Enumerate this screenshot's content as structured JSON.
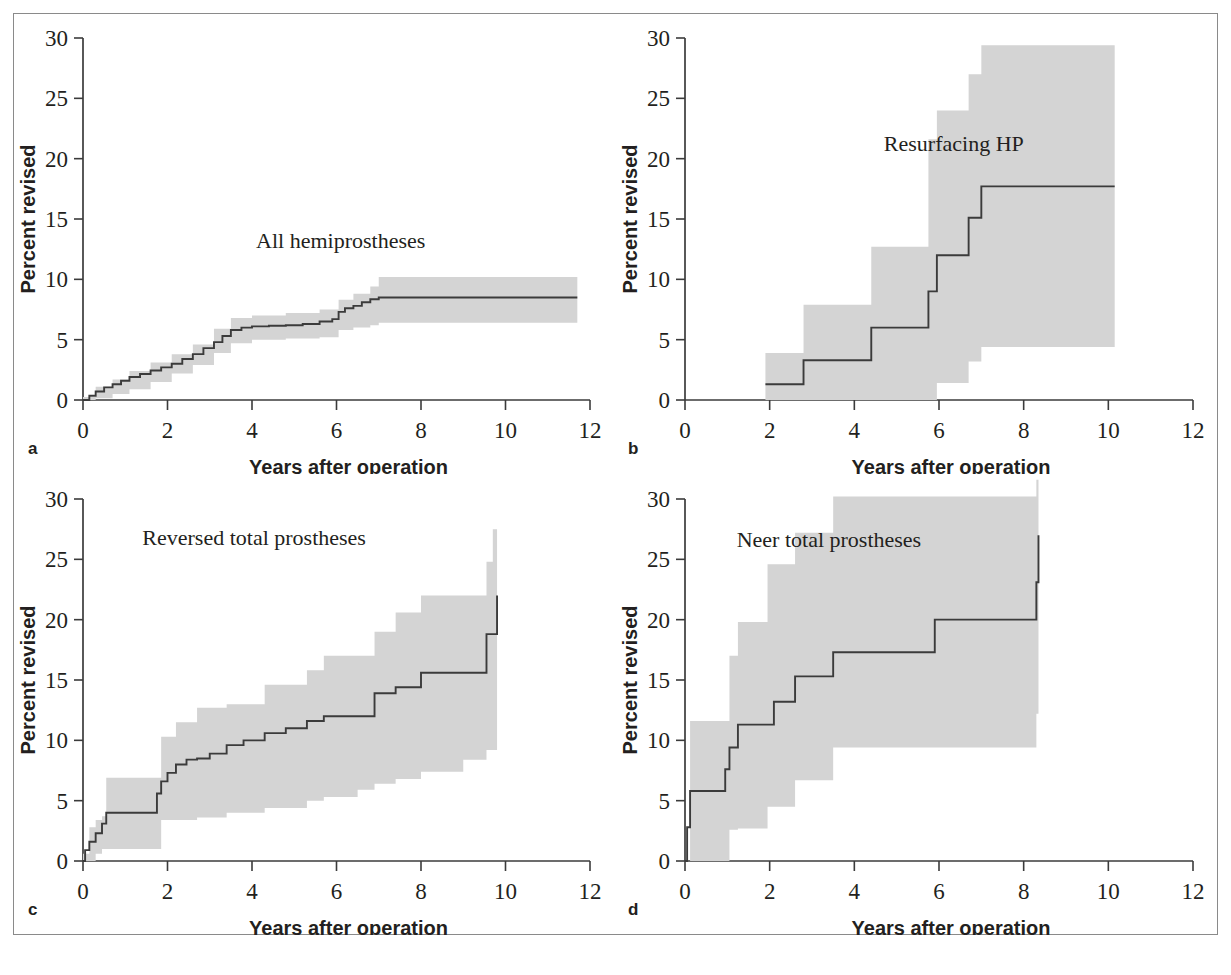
{
  "figure": {
    "kind": "kaplan-meier-revision-panels",
    "panel_count": 4,
    "band_color": "#d4d4d4",
    "line_color": "#3b3b3b"
  },
  "panels": [
    {
      "letter": "a",
      "curve_label": "All hemiprostheses",
      "xlabel": "Years after operation",
      "ylabel": "Percent revised",
      "xticks": [
        "0",
        "2",
        "4",
        "6",
        "8",
        "10",
        "12"
      ],
      "yticks": [
        "0",
        "5",
        "10",
        "15",
        "20",
        "25",
        "30"
      ]
    },
    {
      "letter": "b",
      "curve_label": "Resurfacing HP",
      "xlabel": "Years after operation",
      "ylabel": "Percent revised",
      "xticks": [
        "0",
        "2",
        "4",
        "6",
        "8",
        "10",
        "12"
      ],
      "yticks": [
        "0",
        "5",
        "10",
        "15",
        "20",
        "25",
        "30"
      ]
    },
    {
      "letter": "c",
      "curve_label": "Reversed total prostheses",
      "xlabel": "Years after operation",
      "ylabel": "Percent revised",
      "xticks": [
        "0",
        "2",
        "4",
        "6",
        "8",
        "10",
        "12"
      ],
      "yticks": [
        "0",
        "5",
        "10",
        "15",
        "20",
        "25",
        "30"
      ]
    },
    {
      "letter": "d",
      "curve_label": "Neer total prostheses",
      "xlabel": "Years after operation",
      "ylabel": "Percent revised",
      "xticks": [
        "0",
        "2",
        "4",
        "6",
        "8",
        "10",
        "12"
      ],
      "yticks": [
        "0",
        "5",
        "10",
        "15",
        "20",
        "25",
        "30"
      ]
    }
  ],
  "chart_data": [
    {
      "type": "line",
      "panel": "a",
      "title": "All hemiprostheses",
      "xlabel": "Years after operation",
      "ylabel": "Percent revised",
      "xlim": [
        0,
        12
      ],
      "ylim": [
        0,
        30
      ],
      "xticks": [
        0,
        2,
        4,
        6,
        8,
        10,
        12
      ],
      "yticks": [
        0,
        5,
        10,
        15,
        20,
        25,
        30
      ],
      "grid": false,
      "legend": "none",
      "annotation": "All hemiprostheses",
      "series": [
        {
          "name": "Cumulative percent revised",
          "style": "step",
          "x": [
            0,
            0.15,
            0.3,
            0.5,
            0.7,
            0.9,
            1.1,
            1.35,
            1.6,
            1.85,
            2.1,
            2.35,
            2.6,
            2.85,
            3.1,
            3.3,
            3.5,
            3.75,
            4.0,
            4.4,
            4.8,
            5.2,
            5.6,
            5.9,
            6.05,
            6.2,
            6.4,
            6.6,
            6.8,
            7.0,
            8.0,
            9.0,
            10.0,
            11.0,
            11.7
          ],
          "y": [
            0.0,
            0.35,
            0.7,
            1.05,
            1.3,
            1.6,
            1.9,
            2.15,
            2.45,
            2.7,
            3.0,
            3.4,
            3.8,
            4.3,
            4.8,
            5.3,
            5.8,
            6.0,
            6.1,
            6.15,
            6.2,
            6.3,
            6.5,
            6.7,
            7.3,
            7.6,
            7.8,
            8.1,
            8.35,
            8.5,
            8.5,
            8.5,
            8.5,
            8.5,
            8.5
          ]
        },
        {
          "name": "95% CI upper",
          "style": "step",
          "x": [
            0,
            0.3,
            0.7,
            1.1,
            1.6,
            2.1,
            2.6,
            3.1,
            3.5,
            4.0,
            4.8,
            5.6,
            6.05,
            6.4,
            6.8,
            7.0,
            8.0,
            10.0,
            11.7
          ],
          "y": [
            0.25,
            1.1,
            1.7,
            2.4,
            3.1,
            3.8,
            4.6,
            5.9,
            6.8,
            7.0,
            7.2,
            7.5,
            8.3,
            8.8,
            9.4,
            10.2,
            10.2,
            10.2,
            10.2
          ]
        },
        {
          "name": "95% CI lower",
          "style": "step",
          "x": [
            0,
            0.3,
            0.7,
            1.1,
            1.6,
            2.1,
            2.6,
            3.1,
            3.5,
            4.0,
            4.8,
            5.6,
            6.05,
            6.4,
            6.8,
            7.0,
            8.0,
            10.0,
            11.7
          ],
          "y": [
            0.0,
            0.15,
            0.5,
            0.9,
            1.5,
            2.2,
            2.9,
            3.9,
            4.7,
            5.0,
            5.1,
            5.2,
            5.8,
            6.0,
            6.2,
            6.4,
            6.4,
            6.4,
            6.4
          ]
        }
      ]
    },
    {
      "type": "line",
      "panel": "b",
      "title": "Resurfacing HP",
      "xlabel": "Years after operation",
      "ylabel": "Percent revised",
      "xlim": [
        0,
        12
      ],
      "ylim": [
        0,
        30
      ],
      "xticks": [
        0,
        2,
        4,
        6,
        8,
        10,
        12
      ],
      "yticks": [
        0,
        5,
        10,
        15,
        20,
        25,
        30
      ],
      "grid": false,
      "legend": "none",
      "annotation": "Resurfacing HP",
      "series": [
        {
          "name": "Cumulative percent revised",
          "style": "step",
          "x": [
            1.9,
            2.8,
            4.4,
            5.75,
            5.95,
            6.7,
            7.0,
            10.15
          ],
          "y": [
            1.3,
            3.3,
            6.0,
            9.0,
            12.0,
            15.1,
            17.7,
            17.7
          ]
        },
        {
          "name": "95% CI upper",
          "style": "step",
          "x": [
            1.9,
            2.8,
            4.4,
            5.75,
            5.95,
            6.7,
            7.0,
            10.15
          ],
          "y": [
            3.9,
            7.9,
            12.7,
            21.6,
            24.0,
            27.0,
            29.4,
            29.4
          ]
        },
        {
          "name": "95% CI lower",
          "style": "step",
          "x": [
            1.9,
            2.8,
            4.4,
            5.75,
            5.95,
            6.7,
            7.0,
            10.15
          ],
          "y": [
            0.0,
            0.0,
            0.0,
            0.0,
            1.4,
            3.2,
            4.4,
            4.4
          ]
        }
      ]
    },
    {
      "type": "line",
      "panel": "c",
      "title": "Reversed total prostheses",
      "xlabel": "Years after operation",
      "ylabel": "Percent revised",
      "xlim": [
        0,
        12
      ],
      "ylim": [
        0,
        30
      ],
      "xticks": [
        0,
        2,
        4,
        6,
        8,
        10,
        12
      ],
      "yticks": [
        0,
        5,
        10,
        15,
        20,
        25,
        30
      ],
      "grid": false,
      "legend": "none",
      "annotation": "Reversed total prostheses",
      "series": [
        {
          "name": "Cumulative percent revised",
          "style": "step",
          "x": [
            0,
            0.05,
            0.15,
            0.3,
            0.45,
            0.55,
            1.6,
            1.75,
            1.85,
            2.0,
            2.2,
            2.45,
            2.7,
            3.0,
            3.4,
            3.8,
            4.3,
            4.8,
            5.3,
            5.7,
            6.5,
            6.9,
            7.4,
            8.0,
            9.0,
            9.55,
            9.8
          ],
          "y": [
            0.0,
            0.9,
            1.6,
            2.3,
            3.1,
            4.0,
            4.0,
            5.6,
            6.6,
            7.3,
            8.0,
            8.4,
            8.5,
            8.9,
            9.6,
            10.0,
            10.6,
            11.0,
            11.6,
            12.0,
            12.0,
            13.9,
            14.4,
            15.6,
            15.6,
            18.8,
            22.0
          ]
        },
        {
          "name": "95% CI upper",
          "style": "step",
          "x": [
            0,
            0.15,
            0.3,
            0.45,
            0.55,
            1.6,
            1.85,
            2.2,
            2.7,
            3.4,
            4.3,
            5.3,
            5.7,
            6.5,
            6.9,
            7.4,
            8.0,
            9.0,
            9.55,
            9.7,
            9.8
          ],
          "y": [
            0.6,
            2.8,
            3.4,
            3.7,
            6.9,
            6.9,
            10.3,
            11.5,
            12.7,
            13.0,
            14.6,
            15.8,
            17.0,
            17.0,
            19.0,
            20.6,
            22.0,
            22.0,
            24.8,
            27.5,
            31.5
          ]
        },
        {
          "name": "95% CI lower",
          "style": "step",
          "x": [
            0,
            0.15,
            0.3,
            0.45,
            0.55,
            1.6,
            1.85,
            2.2,
            2.7,
            3.4,
            4.3,
            5.3,
            5.7,
            6.5,
            6.9,
            7.4,
            8.0,
            9.0,
            9.55,
            9.8
          ],
          "y": [
            0.0,
            0.0,
            0.6,
            1.0,
            1.0,
            1.0,
            3.4,
            3.4,
            3.6,
            4.0,
            4.4,
            5.0,
            5.3,
            5.9,
            6.4,
            6.8,
            7.4,
            8.4,
            9.2,
            10.2
          ]
        }
      ]
    },
    {
      "type": "line",
      "panel": "d",
      "title": "Neer total prostheses",
      "xlabel": "Years after operation",
      "ylabel": "Percent revised",
      "xlim": [
        0,
        12
      ],
      "ylim": [
        0,
        30
      ],
      "xticks": [
        0,
        2,
        4,
        6,
        8,
        10,
        12
      ],
      "yticks": [
        0,
        5,
        10,
        15,
        20,
        25,
        30
      ],
      "grid": false,
      "legend": "none",
      "annotation": "Neer total prostheses",
      "series": [
        {
          "name": "Cumulative percent revised",
          "style": "step",
          "x": [
            0,
            0.05,
            0.12,
            0.85,
            0.95,
            1.05,
            1.25,
            1.95,
            2.1,
            2.6,
            3.5,
            5.9,
            8.3,
            8.35
          ],
          "y": [
            0.0,
            2.8,
            5.8,
            5.8,
            7.6,
            9.4,
            11.3,
            11.3,
            13.2,
            15.3,
            17.3,
            20.0,
            23.1,
            27.0
          ]
        },
        {
          "name": "95% CI upper",
          "style": "step",
          "x": [
            0,
            0.12,
            0.85,
            1.05,
            1.25,
            1.95,
            2.6,
            3.5,
            5.9,
            8.3,
            8.35
          ],
          "y": [
            0.0,
            11.6,
            11.6,
            17.0,
            19.8,
            24.6,
            27.2,
            30.2,
            30.2,
            31.6,
            31.6
          ]
        },
        {
          "name": "95% CI lower",
          "style": "step",
          "x": [
            0,
            0.12,
            0.85,
            1.05,
            1.25,
            1.95,
            2.6,
            3.5,
            5.9,
            8.3,
            8.35
          ],
          "y": [
            0.0,
            0.0,
            0.0,
            2.6,
            2.7,
            4.5,
            6.7,
            9.4,
            9.4,
            12.2,
            12.2
          ]
        }
      ]
    }
  ]
}
